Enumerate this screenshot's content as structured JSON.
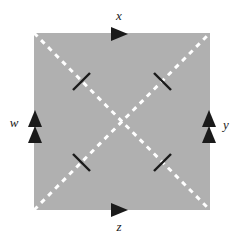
{
  "figure": {
    "canvas": {
      "width": 239,
      "height": 244,
      "background": "#ffffff"
    }
  },
  "square": {
    "name": "fundamental-polygon",
    "fill": "#b0b0b0",
    "x": 34,
    "y": 33,
    "width": 176,
    "height": 177
  },
  "diagonals": {
    "stroke": "#ffffff",
    "style": "dashed",
    "dash": "5 5",
    "width": 3,
    "lines": [
      {
        "name": "diagonal-tl-br",
        "x1": 34,
        "y1": 33,
        "x2": 210,
        "y2": 210
      },
      {
        "name": "diagonal-bl-tr",
        "x1": 34,
        "y1": 210,
        "x2": 210,
        "y2": 33
      }
    ]
  },
  "edges": [
    {
      "id": "top",
      "label": "x",
      "label_x": 119,
      "label_y": 17,
      "arrow_count": 1,
      "direction": "right",
      "arrows": [
        {
          "x": 120,
          "y": 34
        }
      ],
      "color": "#1a1a1a"
    },
    {
      "id": "right",
      "label": "y",
      "label_x": 226,
      "label_y": 126,
      "arrow_count": 2,
      "direction": "up",
      "arrows": [
        {
          "x": 209,
          "y": 119
        },
        {
          "x": 209,
          "y": 134
        }
      ],
      "color": "#1a1a1a"
    },
    {
      "id": "bottom",
      "label": "z",
      "label_x": 119,
      "label_y": 228,
      "arrow_count": 1,
      "direction": "right",
      "arrows": [
        {
          "x": 120,
          "y": 210
        }
      ],
      "color": "#1a1a1a"
    },
    {
      "id": "left",
      "label": "w",
      "label_x": 14,
      "label_y": 124,
      "arrow_count": 2,
      "direction": "up",
      "arrows": [
        {
          "x": 35,
          "y": 119
        },
        {
          "x": 35,
          "y": 134
        }
      ],
      "color": "#1a1a1a"
    }
  ],
  "tick_marks": {
    "stroke": "#1a1a1a",
    "width": 2.4,
    "marks": [
      {
        "name": "tick-top-left",
        "x1": 73,
        "y1": 90,
        "x2": 90,
        "y2": 73
      },
      {
        "name": "tick-top-right",
        "x1": 154,
        "y1": 73,
        "x2": 171,
        "y2": 90
      },
      {
        "name": "tick-bottom-left",
        "x1": 73,
        "y1": 154,
        "x2": 90,
        "y2": 171
      },
      {
        "name": "tick-bottom-right",
        "x1": 154,
        "y1": 171,
        "x2": 171,
        "y2": 154
      }
    ]
  },
  "colors": {
    "square_fill": "#b0b0b0",
    "dash_stroke": "#ffffff",
    "ink": "#1a1a1a",
    "background": "#ffffff"
  }
}
